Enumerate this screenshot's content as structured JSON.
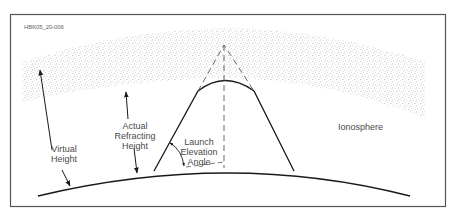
{
  "figure": {
    "id_label": "HBK05_20-006",
    "colors": {
      "frame": "#555555",
      "line": "#1a1a1a",
      "text": "#4a4a4a",
      "speckle": "#9a9a9a"
    }
  },
  "labels": {
    "virtual_height": [
      "Virtual",
      "Height"
    ],
    "actual_refracting_height": [
      "Actual",
      "Refracting",
      "Height"
    ],
    "launch_elevation_angle": [
      "Launch",
      "Elevation",
      "Angle"
    ],
    "ionosphere": "Ionosphere"
  }
}
